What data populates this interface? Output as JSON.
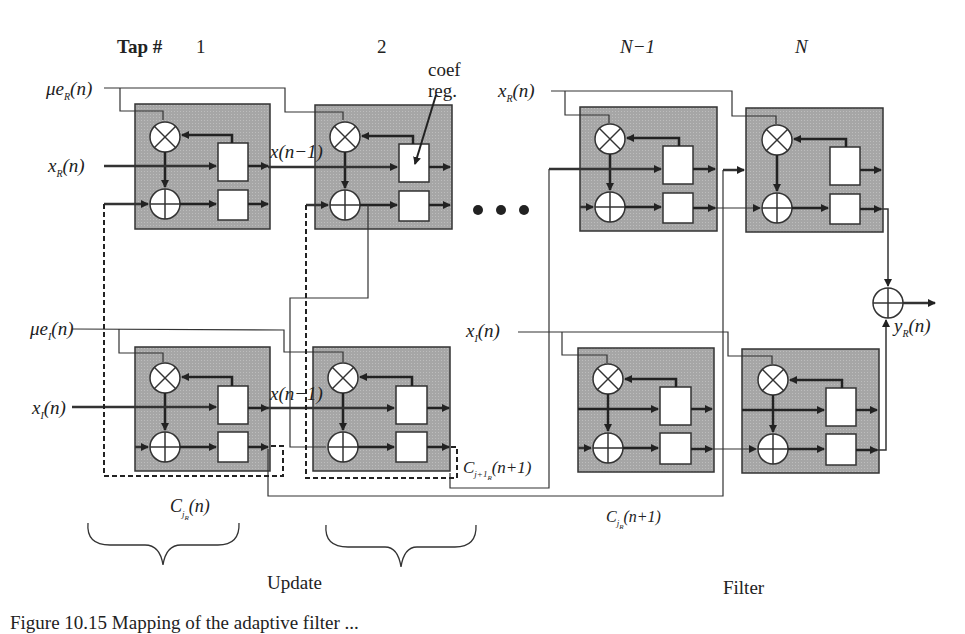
{
  "header": {
    "tap_label": "Tap #",
    "taps": [
      "1",
      "2",
      "N−1",
      "N"
    ]
  },
  "inputs": {
    "mu_e_R": "μe",
    "mu_e_R_sub": "R",
    "mu_e_R_arg": "(n)",
    "x_R": "x",
    "x_R_sub": "R",
    "x_R_arg": "(n)",
    "mu_e_I": "μe",
    "mu_e_I_sub": "I",
    "mu_e_I_arg": "(n)",
    "x_I": "x",
    "x_I_sub": "I",
    "x_I_arg": "(n)",
    "x_R_right": "x",
    "x_R_right_sub": "R",
    "x_R_right_arg": "(n)",
    "x_I_right": "x",
    "x_I_right_sub": "I",
    "x_I_right_arg": "(n)"
  },
  "annotations": {
    "coef_reg_line1": "coef",
    "coef_reg_line2": "reg.",
    "delay_top": "x(n−1)",
    "delay_bottom": "x(n−1)",
    "ellipsis": "• • •",
    "c_next": "C",
    "c_next_sub": "j+1",
    "c_next_subsub": "R",
    "c_next_arg": "(n+1)",
    "c_update": "C",
    "c_update_sub": "j",
    "c_update_subsub": "R",
    "c_update_arg": "(n)",
    "c_filter": "C",
    "c_filter_sub": "j",
    "c_filter_subsub": "R",
    "c_filter_arg": "(n+1)",
    "output": "y",
    "output_sub": "R",
    "output_arg": "(n)"
  },
  "groups": {
    "update_label": "Update",
    "filter_label": "Filter"
  },
  "caption": "Figure 10.15 Mapping of the adaptive filter ...",
  "colors": {
    "cell_fill": "#a9a9a9",
    "line": "#2b2b2b",
    "reg_fill": "#ffffff"
  }
}
